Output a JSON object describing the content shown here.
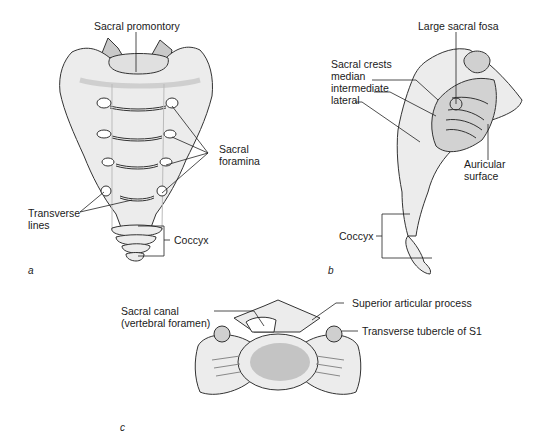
{
  "figure": {
    "panels": [
      {
        "id": "a",
        "view": "anterior",
        "labels": {
          "sacral_promontory": "Sacral promontory",
          "sacral_foramina_1": "Sacral",
          "sacral_foramina_2": "foramina",
          "transverse_lines_1": "Transverse",
          "transverse_lines_2": "lines",
          "coccyx": "Coccyx"
        }
      },
      {
        "id": "b",
        "view": "lateral",
        "labels": {
          "large_sacral_fosa": "Large sacral fosa",
          "sacral_crests": "Sacral crests",
          "median": "median",
          "intermediate": "intermediate",
          "lateral": "lateral",
          "auricular_surface_1": "Auricular",
          "auricular_surface_2": "surface",
          "coccyx": "Coccyx"
        }
      },
      {
        "id": "c",
        "view": "superior",
        "labels": {
          "sacral_canal_1": "Sacral canal",
          "sacral_canal_2": "(vertebral foramen)",
          "superior_articular_process": "Superior articular process",
          "transverse_tubercle": "Transverse tubercle of S1"
        }
      }
    ],
    "colors": {
      "bone_fill": "#ececec",
      "body_center": "#c4c4c4",
      "outline": "#333333",
      "leader": "#222222"
    }
  }
}
